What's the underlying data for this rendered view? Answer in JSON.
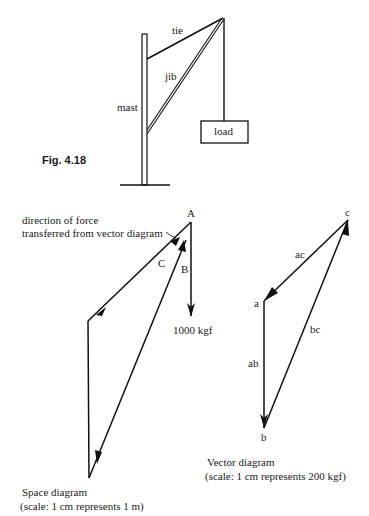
{
  "figure": {
    "label": "Fig. 4.18"
  },
  "crane": {
    "mast_label": "mast",
    "tie_label": "tie",
    "jib_label": "jib",
    "load_label": "load"
  },
  "space_diagram": {
    "annotation_line1": "direction of force",
    "annotation_line2": "transferred from vector diagram",
    "point_A": "A",
    "label_B": "B",
    "label_C": "C",
    "force_label": "1000 kgf",
    "caption": "Space diagram",
    "scale": "(scale:  1 cm represents 1 m)"
  },
  "vector_diagram": {
    "point_a": "a",
    "point_b": "b",
    "point_c": "c",
    "label_ab": "ab",
    "label_bc": "bc",
    "label_ac": "ac",
    "caption": "Vector diagram",
    "scale": "(scale:  1 cm represents 200 kgf)"
  },
  "colors": {
    "ink": "#111111",
    "background": "#ffffff"
  }
}
